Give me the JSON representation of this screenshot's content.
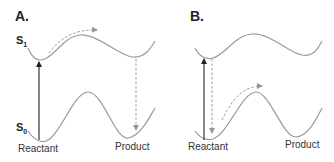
{
  "panels": [
    {
      "label": "A.",
      "s1_label": "S",
      "s1_sub": "1",
      "s0_label": "S",
      "s0_sub": "0",
      "reactant_label": "Reactant",
      "product_label": "Product",
      "description": "Excitation at reactant geometry, motion on S1 to product region, decay to S0 product"
    },
    {
      "label": "B.",
      "reactant_label": "Reactant",
      "product_label": "Product",
      "description": "Excitation at reactant geometry, immediate decay to S0, hot ground-state motion over barrier"
    }
  ],
  "colors": {
    "curve": "#9a9a9a",
    "solid_arrow": "#222222",
    "dashed_arrow": "#9a9a9a",
    "text": "#222222"
  }
}
